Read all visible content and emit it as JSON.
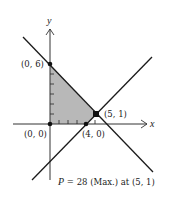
{
  "figure": {
    "axes": {
      "x_label": "x",
      "y_label": "y"
    },
    "points": [
      {
        "label": "(0, 6)",
        "x": 0,
        "y": 6
      },
      {
        "label": "(0, 0)",
        "x": 0,
        "y": 0
      },
      {
        "label": "(4, 0)",
        "x": 4,
        "y": 0
      },
      {
        "label": "(5, 1)",
        "x": 5,
        "y": 1
      }
    ],
    "lines": [
      {
        "name": "decreasing line through (0,6) and (5,1)"
      },
      {
        "name": "increasing line through (4,0) and (5,1)"
      }
    ],
    "feasible_region": {
      "vertices": [
        "(0, 6)",
        "(5, 1)",
        "(4, 0)",
        "(0, 0)"
      ],
      "fill": "#b8b8b8"
    },
    "caption": {
      "var": "P",
      "text": " = 28 (Max.) at (5, 1)"
    },
    "colors": {
      "line": "#1a1a1a",
      "axis": "#333333",
      "shade": "#b8b8b8"
    }
  }
}
